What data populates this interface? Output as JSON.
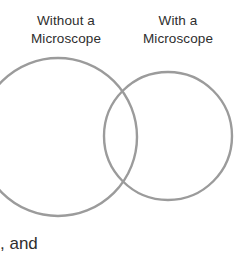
{
  "canvas": {
    "width": 244,
    "height": 264,
    "background_color": "#ffffff"
  },
  "diagram": {
    "type": "venn-two-circle",
    "stroke_color": "#9b9b9b",
    "stroke_width": 2.4,
    "fill": "none",
    "circles": [
      {
        "name": "without-a-microscope",
        "cx": 58,
        "cy": 137,
        "r": 79,
        "clipped_edge": "left"
      },
      {
        "name": "with-a-microscope",
        "cx": 168,
        "cy": 136,
        "r": 64,
        "clipped_edge": "none"
      }
    ]
  },
  "labels": {
    "left": {
      "line1": "Without a",
      "line2": "Microscope"
    },
    "right": {
      "line1": "With a",
      "line2": "Microscope"
    }
  },
  "trailing_text": ", and"
}
